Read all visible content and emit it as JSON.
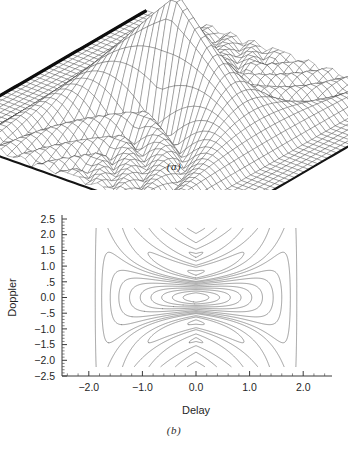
{
  "figure": {
    "panels": [
      {
        "id": "a",
        "caption": "(a)",
        "type": "surface-3d"
      },
      {
        "id": "b",
        "caption": "(b)",
        "type": "contour"
      }
    ]
  },
  "panel_a": {
    "caption": "(a)",
    "render": {
      "mesh_rows": 46,
      "mesh_cols": 46,
      "elev_deg": 26,
      "azim_deg": 38,
      "x_range": [
        -2.6,
        2.6
      ],
      "y_range": [
        -2.6,
        2.6
      ]
    }
  },
  "panel_b": {
    "caption": "(b)"
  },
  "chart_data": [
    {
      "type": "surface",
      "title": "",
      "xlabel": "Delay",
      "ylabel": "Doppler",
      "zlabel": "Ambiguity magnitude",
      "description": "Three-dimensional wireframe mesh of a radar ambiguity function magnitude, showing a tall central ridge peak with oscillating sidelobe ripples decaying toward the edges of the delay-Doppler plane.",
      "xlim": [
        -2.6,
        2.6
      ],
      "ylim": [
        -2.6,
        2.6
      ],
      "zlim": [
        0,
        1
      ],
      "grid": false,
      "legend": "none",
      "peak": {
        "x": 0.0,
        "y": 0.0,
        "z": 1.0
      }
    },
    {
      "type": "contour",
      "title": "",
      "xlabel": "Delay",
      "ylabel": "Doppler",
      "xlim": [
        -2.5,
        2.5
      ],
      "ylim": [
        -2.5,
        2.5
      ],
      "xticks": [
        -2.0,
        -1.0,
        0.0,
        1.0,
        2.0
      ],
      "xticklabels": [
        "-2.0",
        "-1.0",
        "0.0",
        "1.0",
        "2.0"
      ],
      "yticks": [
        2.5,
        2.0,
        1.5,
        1.0,
        0.5,
        0.0,
        -0.5,
        -1.0,
        -1.5,
        -2.0,
        -2.5
      ],
      "yticklabels": [
        "2.5",
        "2.0",
        "1.5",
        "1.0",
        ".5",
        "0.0",
        "-.5",
        "-1.0",
        "-1.5",
        "-2.0",
        "-2.5"
      ],
      "minor_ticks_per_interval": 4,
      "grid": false,
      "legend": "none",
      "levels": [
        0.06,
        0.12,
        0.2,
        0.28,
        0.38,
        0.48,
        0.58,
        0.68,
        0.78,
        0.88
      ],
      "n_levels": 10,
      "axis_style": "left-and-bottom-spines",
      "features": [
        "nested elongated ellipses centered at (0.0, 0.0)",
        "hourglass / bow-tie shaped outer contours pinched near Doppler 0",
        "small isolated closed contour islands near (0.0, 0.7) and (0.0, -0.7)",
        "crescent shaped lobes near Doppler +-1.5",
        "outermost contour reaching delay +-1.8 and Doppler +-1.6"
      ]
    }
  ]
}
